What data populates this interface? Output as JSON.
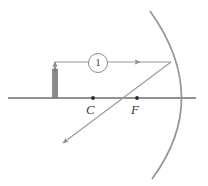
{
  "figure": {
    "kind": "optics-ray-diagram",
    "width": 208,
    "height": 186,
    "background": "#ffffff"
  },
  "labels": {
    "center_of_curvature": "C",
    "focal_point": "F",
    "ray_number": "1"
  },
  "colors": {
    "axis": "#6e6e6e",
    "mirror": "#8f8f8f",
    "ray": "#9a9a9a",
    "object": "#7a7a7a",
    "point": "#2b2b2b",
    "label_text": "#3b3b3b"
  },
  "geometry": {
    "principal_axis": {
      "x1": 8,
      "y1": 98,
      "x2": 196,
      "y2": 98
    },
    "mirror_arc": {
      "type": "concave",
      "vertex": {
        "x": 187,
        "y": 98
      },
      "top_end": {
        "x": 150,
        "y": 11
      },
      "bottom_end": {
        "x": 152,
        "y": 179
      }
    },
    "points": [
      {
        "name": "C",
        "x": 93,
        "y": 98
      },
      {
        "name": "F",
        "x": 137,
        "y": 98
      }
    ],
    "object": {
      "name": "upright-object",
      "base": {
        "x": 55,
        "y": 98
      },
      "top": {
        "x": 55,
        "y": 62
      },
      "width": 5
    },
    "incident_ray": {
      "from": {
        "x": 55,
        "y": 62
      },
      "to": {
        "x": 171,
        "y": 62
      },
      "arrow_at": {
        "x": 138,
        "y": 62
      },
      "direction": "right"
    },
    "reflected_ray": {
      "from": {
        "x": 171,
        "y": 62
      },
      "to": {
        "x": 63,
        "y": 143
      },
      "passes_through": "F",
      "arrow_at": {
        "x": 63,
        "y": 143
      },
      "direction": "down-left"
    }
  }
}
